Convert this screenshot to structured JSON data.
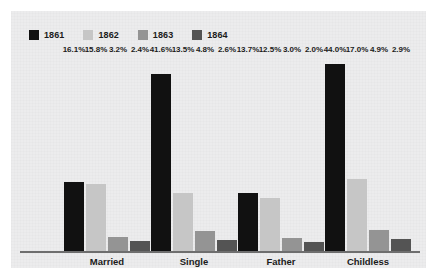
{
  "chart_data": {
    "type": "bar",
    "title": "",
    "subtitle": "",
    "xlabel": "",
    "ylabel": "",
    "ylim": [
      0,
      46
    ],
    "grid": false,
    "legend_position": "top-left",
    "categories": [
      "Married",
      "Single",
      "Father",
      "Childless"
    ],
    "series": [
      {
        "name": "1861",
        "color": "#111111",
        "values": [
          16.1,
          41.6,
          13.7,
          44.0
        ],
        "labels": [
          "16.1%",
          "41.6%",
          "13.7%",
          "44.0%"
        ]
      },
      {
        "name": "1862",
        "color": "#c6c6c6",
        "values": [
          15.8,
          13.5,
          12.5,
          17.0
        ],
        "labels": [
          "15.8%",
          "13.5%",
          "12.5%",
          "17.0%"
        ]
      },
      {
        "name": "1863",
        "color": "#949494",
        "values": [
          3.2,
          4.8,
          3.0,
          4.9
        ],
        "labels": [
          "3.2%",
          "4.8%",
          "3.0%",
          "4.9%"
        ]
      },
      {
        "name": "1864",
        "color": "#545454",
        "values": [
          2.4,
          2.6,
          2.0,
          2.9
        ],
        "labels": [
          "2.4%",
          "2.6%",
          "2.0%",
          "2.9%"
        ]
      }
    ]
  },
  "legend": {
    "items": [
      {
        "label": "1861",
        "color": "#111111"
      },
      {
        "label": "1862",
        "color": "#c6c6c6"
      },
      {
        "label": "1863",
        "color": "#949494"
      },
      {
        "label": "1864",
        "color": "#545454"
      }
    ]
  },
  "axis": {
    "categories": [
      {
        "label": "Married"
      },
      {
        "label": "Single"
      },
      {
        "label": "Father"
      },
      {
        "label": "Childless"
      }
    ]
  },
  "colors": {
    "panel_background": "#ececed",
    "page_background": "#ffffff",
    "axis_line": "#6e6e6e",
    "text": "#1b1b1b"
  }
}
